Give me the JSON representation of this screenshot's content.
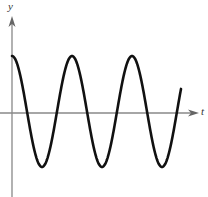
{
  "chart_data": {
    "type": "line",
    "title": "",
    "xlabel": "t",
    "ylabel": "y",
    "function": "cosine",
    "series": [
      {
        "name": "y(t)",
        "shape": "cosine wave starting at maximum on the y-axis",
        "periods_shown": 2.82,
        "peaks_px_x": [
          12,
          73,
          132
        ],
        "troughs_px_x": [
          43,
          102,
          162
        ],
        "peak_px_y": 56,
        "trough_px_y": 167
      }
    ],
    "x_ticks": [],
    "y_ticks": [],
    "grid": false,
    "legend": "none",
    "axes": {
      "origin_px": [
        12,
        113
      ],
      "x_axis_arrow": true,
      "y_axis_arrow": true
    },
    "colors": {
      "curve": "#111111",
      "axes": "#888888",
      "labels": "#333333"
    }
  },
  "labels": {
    "x_axis": "t",
    "y_axis": "y"
  }
}
